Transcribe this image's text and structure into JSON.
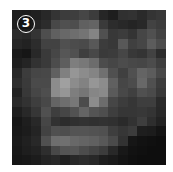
{
  "badge": {
    "label": "3"
  },
  "tile": {
    "rows": 16,
    "cols": 16,
    "gray": [
      [
        30,
        28,
        32,
        40,
        52,
        60,
        62,
        70,
        60,
        38,
        30,
        48,
        50,
        42,
        52,
        56
      ],
      [
        32,
        30,
        36,
        44,
        72,
        80,
        78,
        96,
        100,
        58,
        44,
        40,
        36,
        40,
        66,
        60
      ],
      [
        44,
        40,
        52,
        78,
        96,
        104,
        110,
        116,
        132,
        80,
        56,
        60,
        52,
        70,
        80,
        66
      ],
      [
        38,
        34,
        44,
        66,
        66,
        80,
        76,
        74,
        88,
        60,
        56,
        88,
        64,
        70,
        92,
        76
      ],
      [
        26,
        22,
        40,
        58,
        70,
        86,
        80,
        62,
        72,
        58,
        60,
        70,
        56,
        52,
        66,
        44
      ],
      [
        30,
        36,
        50,
        58,
        76,
        94,
        126,
        120,
        108,
        76,
        70,
        76,
        72,
        70,
        76,
        62
      ],
      [
        40,
        60,
        70,
        72,
        96,
        128,
        150,
        140,
        132,
        112,
        80,
        64,
        80,
        100,
        92,
        72
      ],
      [
        46,
        58,
        74,
        74,
        140,
        160,
        140,
        130,
        150,
        140,
        96,
        70,
        76,
        104,
        80,
        60
      ],
      [
        34,
        56,
        70,
        78,
        140,
        150,
        126,
        118,
        134,
        138,
        90,
        72,
        64,
        80,
        74,
        56
      ],
      [
        42,
        50,
        62,
        72,
        100,
        110,
        120,
        76,
        140,
        108,
        70,
        60,
        54,
        62,
        62,
        42
      ],
      [
        30,
        40,
        54,
        80,
        62,
        70,
        82,
        100,
        84,
        78,
        62,
        54,
        54,
        56,
        52,
        40
      ],
      [
        22,
        30,
        40,
        70,
        50,
        44,
        48,
        50,
        48,
        50,
        48,
        42,
        50,
        62,
        46,
        34
      ],
      [
        24,
        28,
        36,
        66,
        80,
        78,
        84,
        84,
        82,
        80,
        62,
        54,
        60,
        30,
        28,
        20
      ],
      [
        26,
        32,
        40,
        80,
        110,
        112,
        104,
        100,
        96,
        88,
        74,
        50,
        22,
        18,
        16,
        14
      ],
      [
        24,
        30,
        34,
        46,
        72,
        84,
        86,
        76,
        68,
        60,
        40,
        24,
        18,
        16,
        14,
        14
      ],
      [
        22,
        24,
        28,
        36,
        40,
        32,
        40,
        44,
        40,
        30,
        26,
        20,
        16,
        14,
        14,
        14
      ]
    ]
  }
}
